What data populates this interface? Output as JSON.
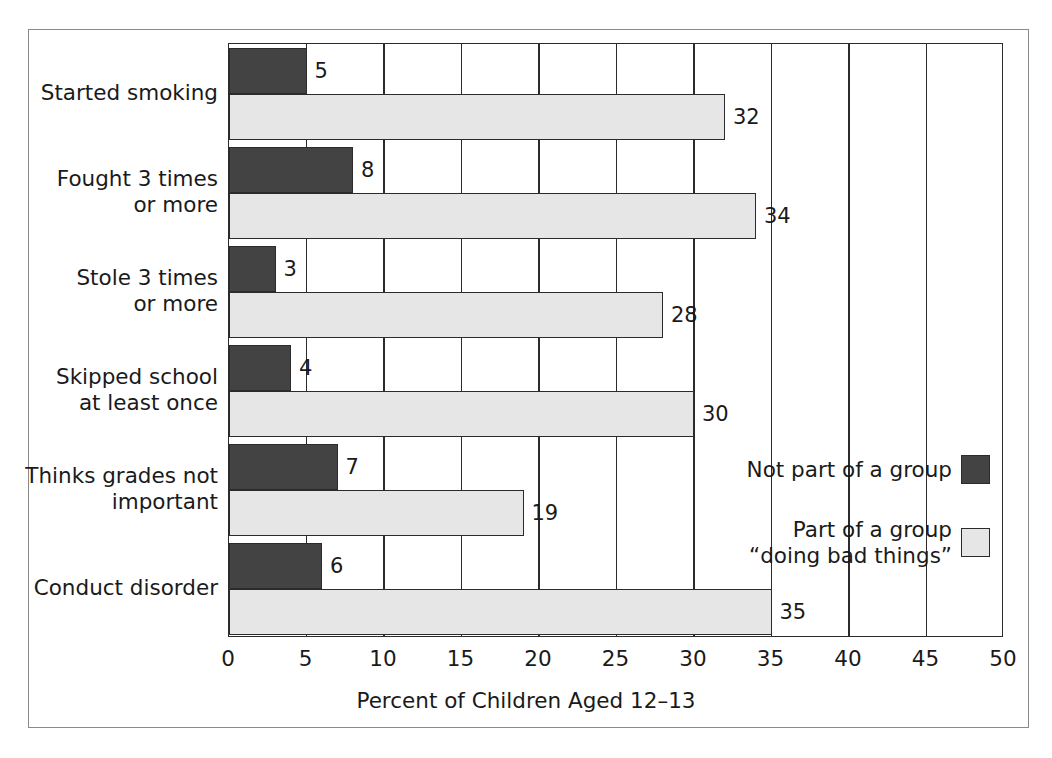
{
  "chart_data": {
    "type": "bar",
    "orientation": "horizontal",
    "title": "",
    "xlabel": "Percent of Children Aged 12–13",
    "ylabel": "",
    "xlim": [
      0,
      50
    ],
    "xticks": [
      0,
      5,
      10,
      15,
      20,
      25,
      30,
      35,
      40,
      45,
      50
    ],
    "xtick_labels": [
      "0",
      "5",
      "10",
      "15",
      "20",
      "25",
      "30",
      "35",
      "40",
      "45",
      "50"
    ],
    "grid": "vertical",
    "legend_position": "right-inside",
    "categories": [
      "Started smoking",
      "Fought 3 times\nor more",
      "Stole 3 times\nor more",
      "Skipped school\nat least once",
      "Thinks grades not\nimportant",
      "Conduct disorder"
    ],
    "series": [
      {
        "name": "Not part of a group",
        "color": "#434343",
        "values": [
          5,
          8,
          3,
          4,
          7,
          6
        ],
        "value_labels": [
          "5",
          "8",
          "3",
          "4",
          "7",
          "6"
        ]
      },
      {
        "name": "Part of a group\n“doing bad things”",
        "color": "#e6e6e6",
        "values": [
          32,
          34,
          28,
          30,
          19,
          35
        ],
        "value_labels": [
          "32",
          "34",
          "28",
          "30",
          "19",
          "35"
        ]
      }
    ]
  },
  "legend": {
    "entries": [
      {
        "label": "Not part of a group",
        "color": "#434343"
      },
      {
        "label": "Part of a group\n“doing bad things”",
        "color": "#e6e6e6"
      }
    ]
  },
  "colors": {
    "dark_bar": "#434343",
    "light_bar": "#e6e6e6",
    "axis": "#2b2b2b",
    "frame": "#8a8a8a",
    "background": "#ffffff",
    "text": "#1a1a1a"
  }
}
